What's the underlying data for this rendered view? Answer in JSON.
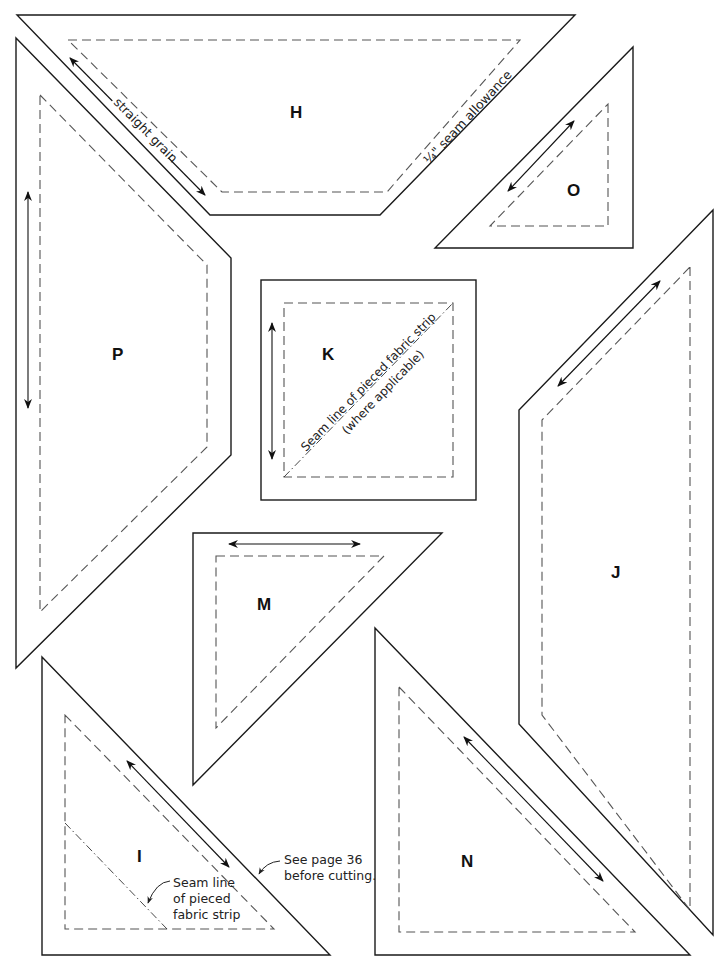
{
  "diagram": {
    "type": "quilt-pattern-templates",
    "colors": {
      "cut_line": "#1a1a1a",
      "seam_line": "#555555",
      "background": "#ffffff"
    },
    "pieces": [
      {
        "id": "H",
        "label": "H",
        "shape": "trapezoid",
        "grain_arrow": "diagonal (parallel to left edge)"
      },
      {
        "id": "O",
        "label": "O",
        "shape": "right-triangle",
        "grain_arrow": "diagonal (parallel to hypotenuse)"
      },
      {
        "id": "P",
        "label": "P",
        "shape": "pentagon",
        "grain_arrow": "vertical"
      },
      {
        "id": "K",
        "label": "K",
        "shape": "square",
        "grain_arrow": "vertical"
      },
      {
        "id": "J",
        "label": "J",
        "shape": "pentagon",
        "grain_arrow": "diagonal (parallel to top-left edge)"
      },
      {
        "id": "M",
        "label": "M",
        "shape": "right-triangle",
        "grain_arrow": "horizontal"
      },
      {
        "id": "I",
        "label": "I",
        "shape": "right-triangle",
        "grain_arrow": "diagonal (parallel to hypotenuse)"
      },
      {
        "id": "N",
        "label": "N",
        "shape": "right-triangle",
        "grain_arrow": "diagonal (parallel to hypotenuse)"
      }
    ],
    "annotations": {
      "straight_grain": "straight grain",
      "seam_allowance": "¼\" seam allowance",
      "k_seam_line_1": "Seam line of pieced fabric strip",
      "k_seam_line_2": "(where applicable)",
      "i_seam_line_1": "Seam line",
      "i_seam_line_2": "of pieced",
      "i_seam_line_3": "fabric strip",
      "see_page_1": "See page 36",
      "see_page_2": "before cutting."
    }
  }
}
